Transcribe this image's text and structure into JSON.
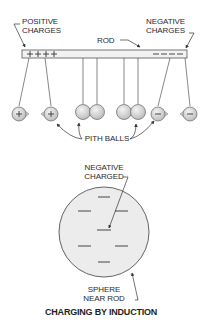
{
  "diagram": {
    "title": "CHARGING BY INDUCTION",
    "labels": {
      "positive_line1": "POSITIVE",
      "positive_line2": "CHARGES",
      "negative_line1": "NEGATIVE",
      "negative_line2": "CHARGES",
      "rod": "ROD",
      "pith_balls": "PITH BALLS",
      "sphere_charge_line1": "NEGATIVE",
      "sphere_charge_line2": "CHARGED",
      "sphere_line1": "SPHERE",
      "sphere_line2": "NEAR ROD"
    },
    "rod": {
      "positive_symbols": [
        "+",
        "+",
        "+",
        "+"
      ],
      "negative_symbols": [
        "−",
        "−",
        "−",
        "−"
      ]
    },
    "pith_balls": [
      {
        "position": "far-left",
        "charge": "+"
      },
      {
        "position": "left",
        "charge": "+"
      },
      {
        "position": "center-left-a",
        "charge": ""
      },
      {
        "position": "center-left-b",
        "charge": ""
      },
      {
        "position": "center-right-a",
        "charge": ""
      },
      {
        "position": "center-right-b",
        "charge": ""
      },
      {
        "position": "right",
        "charge": "−"
      },
      {
        "position": "far-right",
        "charge": "−"
      }
    ],
    "sphere": {
      "charge_marks": 7,
      "charge_symbol": "−"
    },
    "colors": {
      "line": "#555555",
      "ball_fill": "#d9d9d9",
      "sphere_fill": "#ececec",
      "rod_fill": "#f2f2f2"
    }
  }
}
